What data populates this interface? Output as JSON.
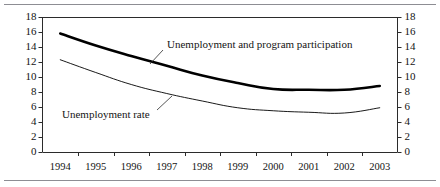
{
  "figure": {
    "background_color": "#ffffff",
    "rule_color": "#8d8d93",
    "axis_color": "#2b2b2b"
  },
  "chart_data": {
    "type": "line",
    "title": "",
    "subtitle": "",
    "xlabel": "",
    "ylabel": "",
    "x": [
      1994,
      1995,
      1996,
      1997,
      1998,
      1999,
      2000,
      2001,
      2002,
      2003
    ],
    "categories": [
      "1994",
      "1995",
      "1996",
      "1997",
      "1998",
      "1999",
      "2000",
      "2001",
      "2002",
      "2003"
    ],
    "series": [
      {
        "name": "Unemployment and program participation",
        "values": [
          15.8,
          14.2,
          12.8,
          11.5,
          10.2,
          9.2,
          8.4,
          8.3,
          8.3,
          8.8
        ],
        "style": "thick",
        "color": "#000000",
        "line_width": 2.6
      },
      {
        "name": "Unemployment rate",
        "values": [
          12.3,
          10.6,
          9.0,
          7.8,
          6.8,
          5.9,
          5.5,
          5.3,
          5.2,
          5.9
        ],
        "style": "thin",
        "color": "#000000",
        "line_width": 0.9
      }
    ],
    "ylim": [
      0,
      18
    ],
    "yticks": [
      0,
      2,
      4,
      6,
      8,
      10,
      12,
      14,
      16,
      18
    ],
    "ytick_labels_left": [
      "18",
      "16",
      "14",
      "12",
      "10",
      "8",
      "6",
      "4",
      "2",
      "0"
    ],
    "ytick_labels_right": [
      "18",
      "16",
      "14",
      "12",
      "10",
      "8",
      "6",
      "4",
      "2",
      "0"
    ],
    "xlim": [
      1993.5,
      2003.5
    ],
    "grid": false,
    "legend": "inline-annotations",
    "dual_y_axis": true,
    "annotations": [
      {
        "text": "Unemployment and program participation",
        "target_series": "Unemployment and program participation",
        "leader_line": true
      },
      {
        "text": "Unemployment rate",
        "target_series": "Unemployment rate",
        "leader_line": true
      }
    ]
  }
}
